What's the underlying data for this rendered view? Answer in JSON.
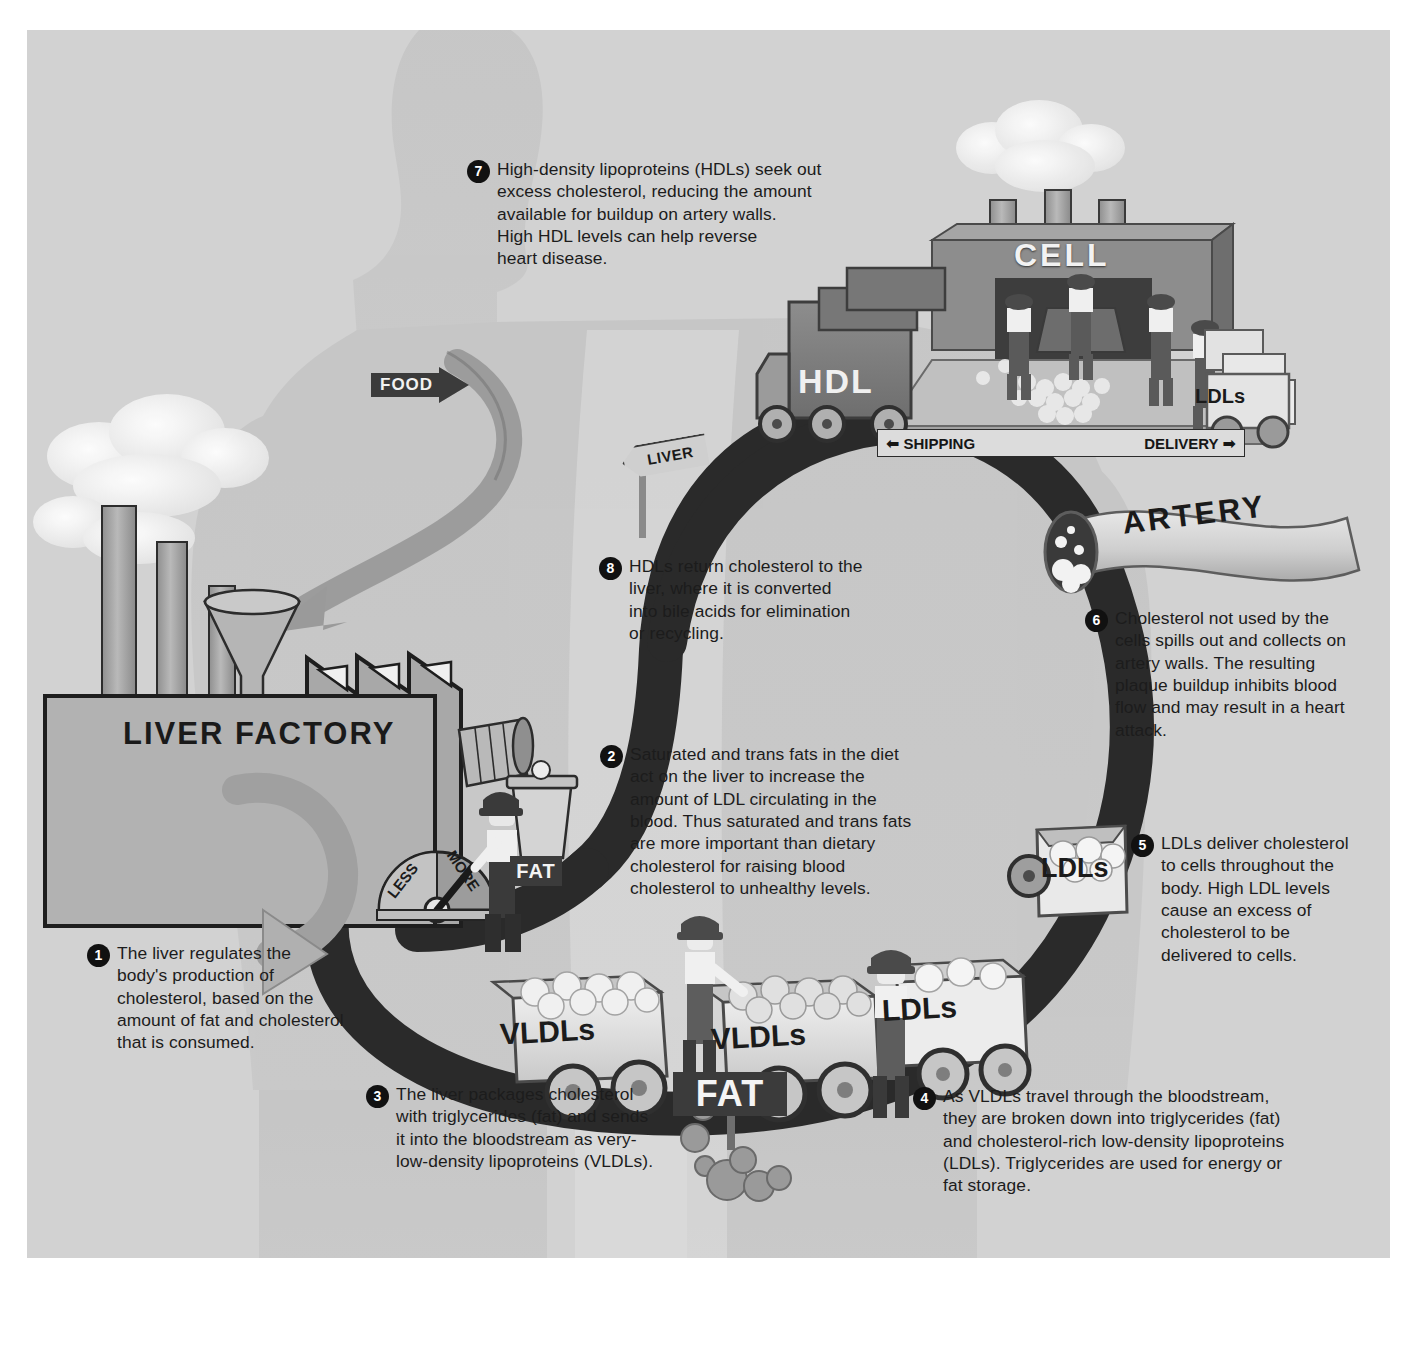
{
  "figure": {
    "background_color": "#d2d2d2",
    "ink_color": "#1c1c1c"
  },
  "steps": [
    {
      "number": "1",
      "text": "The liver regulates the\nbody's production of\ncholesterol, based on the\namount of fat and cholesterol\nthat is consumed."
    },
    {
      "number": "2",
      "text": "Saturated and trans fats in the diet\nact on the liver to increase the\namount of LDL circulating in the\nblood. Thus saturated and trans fats\nare more important than dietary\ncholesterol for raising blood\ncholesterol to unhealthy levels."
    },
    {
      "number": "3",
      "text": "The liver packages cholesterol\nwith triglycerides (fat) and sends\nit into the bloodstream as very-\nlow-density lipoproteins (VLDLs)."
    },
    {
      "number": "4",
      "text": "As VLDLs travel through the bloodstream,\nthey are broken down into triglycerides (fat)\nand cholesterol-rich low-density lipoproteins\n(LDLs). Triglycerides are used for energy or\nfat storage."
    },
    {
      "number": "5",
      "text": "LDLs deliver cholesterol\nto cells throughout the\nbody. High LDL levels\ncause an excess of\ncholesterol to be\ndelivered to cells."
    },
    {
      "number": "6",
      "text": "Cholesterol not used by the\ncells spills out and collects on\nartery walls. The resulting\nplaque buildup inhibits blood\nflow and may result in a heart\nattack."
    },
    {
      "number": "7",
      "text": "High-density lipoproteins (HDLs) seek out\nexcess cholesterol, reducing the amount\navailable for buildup on artery walls.\nHigh HDL levels can help reverse\nheart disease."
    },
    {
      "number": "8",
      "text": "HDLs return cholesterol to the\nliver, where it is converted\ninto bile acids for elimination\nor recycling."
    }
  ],
  "labels": {
    "liver_factory": "LIVER FACTORY",
    "cell": "CELL",
    "artery": "ARTERY",
    "food_sign": "FOOD",
    "liver_signpost": "LIVER",
    "shipping": "SHIPPING",
    "delivery": "DELIVERY",
    "hdl_truck": "HDL",
    "ldls_truck_cell": "LDLs",
    "ldls_truck_artery": "LDLs",
    "ldls_cart": "LDLs",
    "vldls_cart_1": "VLDLs",
    "vldls_cart_2": "VLDLs",
    "fat_sign_gauge": "FAT",
    "fat_sign_road": "FAT",
    "gauge_less": "LESS",
    "gauge_more": "MORE"
  }
}
